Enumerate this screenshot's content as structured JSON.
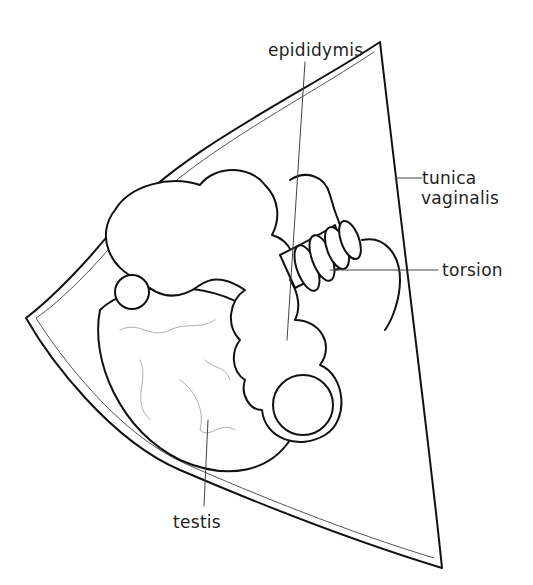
{
  "figure": {
    "type": "anatomical line drawing",
    "labels": {
      "epididymis": "epididymis",
      "tunica_line1": "tunica",
      "tunica_line2": "vaginalis",
      "torsion": "torsion",
      "testis": "testis"
    },
    "colors": {
      "line": "#111111",
      "leader": "#444444",
      "background": "#ffffff"
    }
  }
}
